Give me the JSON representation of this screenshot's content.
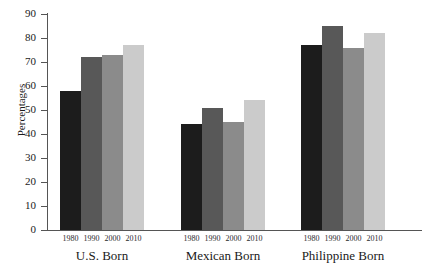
{
  "chart_data": {
    "type": "bar",
    "title": "Adult Urbanized Women",
    "xlabel": "",
    "ylabel": "Percentages",
    "ylim": [
      0,
      90
    ],
    "yticks": [
      0,
      10,
      20,
      30,
      40,
      50,
      60,
      70,
      80,
      90
    ],
    "ytick_labels": [
      "0",
      "10",
      "20",
      "30",
      "40",
      "50",
      "60",
      "70",
      "80",
      "90"
    ],
    "grid": false,
    "legend": "none",
    "categories": [
      "U.S. Born",
      "Mexican Born",
      "Philippine Born"
    ],
    "subcategories": [
      "1980",
      "1990",
      "2000",
      "2010"
    ],
    "series": [
      {
        "name": "1980",
        "color": "#1c1c1c",
        "values": [
          58,
          44,
          77
        ]
      },
      {
        "name": "1990",
        "color": "#585858",
        "values": [
          72,
          51,
          85
        ]
      },
      {
        "name": "2000",
        "color": "#8b8b8b",
        "values": [
          73,
          45,
          76
        ]
      },
      {
        "name": "2010",
        "color": "#cbcbcb",
        "values": [
          77,
          54,
          82
        ]
      }
    ],
    "groups": [
      {
        "label": "U.S. Born",
        "bars": [
          {
            "year": "1980",
            "value": 58,
            "color": "#1c1c1c"
          },
          {
            "year": "1990",
            "value": 72,
            "color": "#585858"
          },
          {
            "year": "2000",
            "value": 73,
            "color": "#8b8b8b"
          },
          {
            "year": "2010",
            "value": 77,
            "color": "#cbcbcb"
          }
        ]
      },
      {
        "label": "Mexican Born",
        "bars": [
          {
            "year": "1980",
            "value": 44,
            "color": "#1c1c1c"
          },
          {
            "year": "1990",
            "value": 51,
            "color": "#585858"
          },
          {
            "year": "2000",
            "value": 45,
            "color": "#8b8b8b"
          },
          {
            "year": "2010",
            "value": 54,
            "color": "#cbcbcb"
          }
        ]
      },
      {
        "label": "Philippine Born",
        "bars": [
          {
            "year": "1980",
            "value": 77,
            "color": "#1c1c1c"
          },
          {
            "year": "1990",
            "value": 85,
            "color": "#585858"
          },
          {
            "year": "2000",
            "value": 76,
            "color": "#8b8b8b"
          },
          {
            "year": "2010",
            "value": 82,
            "color": "#cbcbcb"
          }
        ]
      }
    ]
  }
}
